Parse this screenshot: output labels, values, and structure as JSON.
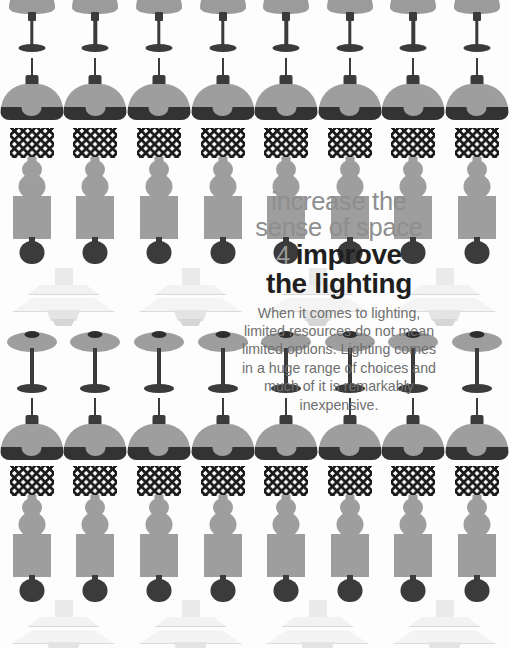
{
  "poster": {
    "kicker": "increase the\nsense of space",
    "item_number": "4",
    "headline_part1": "improve",
    "headline_part2": "the lighting",
    "body": "When it comes to lighting,\nlimited resources do not mean\nlimited options. Lighting comes\nin a huge range of choices and\nmuch of it is remarkably\ninexpensive."
  },
  "colors": {
    "background": "#fdfdfd",
    "lamp_gray": "#9e9e9e",
    "lamp_dark": "#3b3b3b",
    "pattern_black": "#1a1a1a",
    "ph_white": "#f2f2f2",
    "kicker_text": "#8e8e8e",
    "number_text": "#9a9a9a",
    "headline_text": "#1f1f1f",
    "body_text": "#6f6f6f"
  },
  "rows": [
    {
      "name": "bell-table-lamp-row",
      "type": "bell",
      "top": -16,
      "count": 8,
      "cell": 63.6
    },
    {
      "name": "dome-pendant-row-1",
      "type": "dome",
      "top": 58,
      "count": 8,
      "cell": 63.6
    },
    {
      "name": "harlequin-lamp-row-1",
      "type": "harlequin",
      "top": 128,
      "count": 8,
      "cell": 63.6
    },
    {
      "name": "rect-shade-lamp-row-1",
      "type": "rect",
      "top": 196,
      "count": 8,
      "cell": 63.6
    },
    {
      "name": "ph-pendant-row-1",
      "type": "ph",
      "top": 268,
      "count": 4,
      "cell": 127
    },
    {
      "name": "disc-table-lamp-row-1",
      "type": "disc",
      "top": 330,
      "count": 8,
      "cell": 63.6
    },
    {
      "name": "dome-pendant-row-2",
      "type": "dome",
      "top": 398,
      "count": 8,
      "cell": 63.6
    },
    {
      "name": "harlequin-lamp-row-2",
      "type": "harlequin",
      "top": 466,
      "count": 8,
      "cell": 63.6
    },
    {
      "name": "rect-shade-lamp-row-2",
      "type": "rect",
      "top": 534,
      "count": 8,
      "cell": 63.6
    },
    {
      "name": "ph-pendant-row-2",
      "type": "ph",
      "top": 600,
      "count": 4,
      "cell": 127
    }
  ],
  "textblock": {
    "top": 188
  }
}
